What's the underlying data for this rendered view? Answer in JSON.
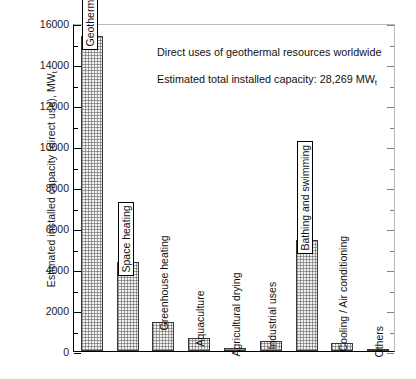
{
  "chart_data": {
    "type": "bar",
    "title": "",
    "xlabel": "",
    "ylabel": "Estimated installed capacity (direct use), MW",
    "ylabel_subscript": "t",
    "ylim": [
      0,
      16000
    ],
    "ytick_labels": [
      "0",
      "2000",
      "4000",
      "6000",
      "8000",
      "10000",
      "12000",
      "14000",
      "16000"
    ],
    "ytick_values": [
      0,
      2000,
      4000,
      6000,
      8000,
      10000,
      12000,
      14000,
      16000
    ],
    "yminor_interval": 1000,
    "grid": false,
    "legend": "none",
    "categories": [
      "Geothermal heat pumps",
      "Space heating",
      "Greenhouse heating",
      "Aquaculture",
      "Agricultural drying",
      "Industrial uses",
      "Bathing and swimming",
      "Cooling / Air conditioning",
      "Others"
    ],
    "values": [
      15384,
      4326,
      1404,
      616,
      157,
      489,
      5401,
      371,
      86
    ],
    "bar_fill": "#f2f2f2",
    "bar_edge": "#3a3a3a",
    "label_boxed": [
      true,
      true,
      false,
      false,
      false,
      false,
      true,
      false,
      false
    ],
    "annotations": [
      "Direct uses of geothermal resources worldwide",
      "Estimated total installed capacity: 28,269 MW"
    ],
    "annotation_subscript": "t"
  }
}
